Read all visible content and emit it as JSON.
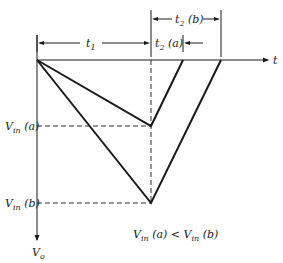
{
  "diagram": {
    "axis_labels": {
      "x": "t",
      "y": "V",
      "y_sub": "o"
    },
    "dimensions": {
      "t1": {
        "main": "t",
        "sub": "1"
      },
      "t2a": {
        "main": "t",
        "sub": "2",
        "suffix": " (a)"
      },
      "t2b": {
        "main": "t",
        "sub": "2",
        "suffix": " (b)"
      }
    },
    "levels": {
      "vin_a": {
        "main": "V",
        "sub": "in",
        "suffix": " (a)"
      },
      "vin_b": {
        "main": "V",
        "sub": "in",
        "suffix": " (b)"
      }
    },
    "relation": {
      "a_main": "V",
      "a_sub": "in",
      "a_suffix": " (a) < ",
      "b_main": "V",
      "b_sub": "in",
      "b_suffix": " (b)"
    },
    "colors": {
      "line": "#1a1a1a",
      "dashed": "#333333"
    }
  }
}
